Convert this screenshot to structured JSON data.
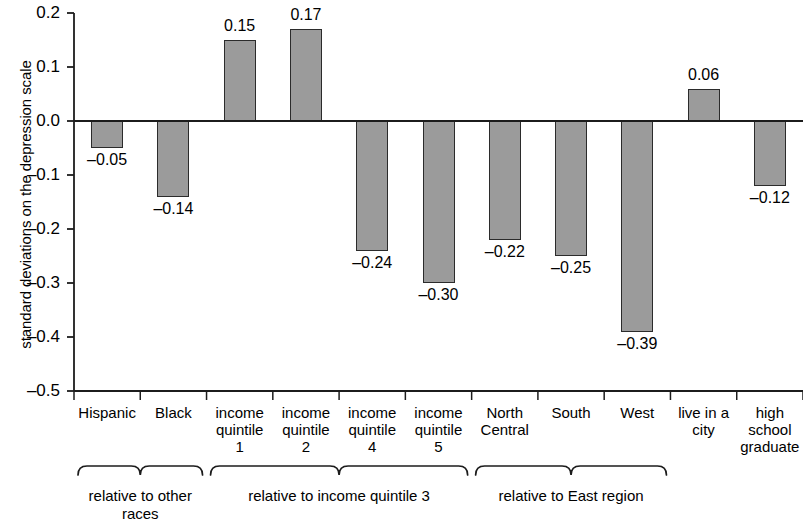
{
  "chart_data": {
    "type": "bar",
    "title": "",
    "subtitle": "",
    "xlabel": "",
    "ylabel": "standard deviations on the depression scale",
    "ylim": [
      -0.5,
      0.2
    ],
    "ytick_labels": [
      "0.2",
      "0.1",
      "0.0",
      "-0.1",
      "-0.2",
      "-0.3",
      "-0.4",
      "-0.5"
    ],
    "ytick_values": [
      0.2,
      0.1,
      0.0,
      -0.1,
      -0.2,
      -0.3,
      -0.4,
      -0.5
    ],
    "grid": false,
    "legend": "none",
    "bar_color": "#9b9b9b",
    "bar_edge_color": "#2b2b2b",
    "categories": [
      "Hispanic",
      "Black",
      "income quintile 1",
      "income quintile 2",
      "income quintile 4",
      "income quintile 5",
      "North Central",
      "South",
      "West",
      "live in a city",
      "high school graduate"
    ],
    "category_label_lines": [
      [
        "Hispanic"
      ],
      [
        "Black"
      ],
      [
        "income",
        "quintile",
        "1"
      ],
      [
        "income",
        "quintile",
        "2"
      ],
      [
        "income",
        "quintile",
        "4"
      ],
      [
        "income",
        "quintile",
        "5"
      ],
      [
        "North",
        "Central"
      ],
      [
        "South"
      ],
      [
        "West"
      ],
      [
        "live in a",
        "city"
      ],
      [
        "high",
        "school",
        "graduate"
      ]
    ],
    "values": [
      -0.05,
      -0.14,
      0.15,
      0.17,
      -0.24,
      -0.3,
      -0.22,
      -0.25,
      -0.39,
      0.06,
      -0.12
    ],
    "value_labels": [
      "-0.05",
      "-0.14",
      "0.15",
      "0.17",
      "-0.24",
      "-0.30",
      "-0.22",
      "-0.25",
      "-0.39",
      "0.06",
      "-0.12"
    ],
    "groups": [
      {
        "label_lines": [
          "relative to other",
          "races"
        ],
        "start_index": 0,
        "end_index": 1
      },
      {
        "label_lines": [
          "relative to income quintile 3"
        ],
        "start_index": 2,
        "end_index": 5
      },
      {
        "label_lines": [
          "relative to East region"
        ],
        "start_index": 6,
        "end_index": 8
      }
    ]
  }
}
